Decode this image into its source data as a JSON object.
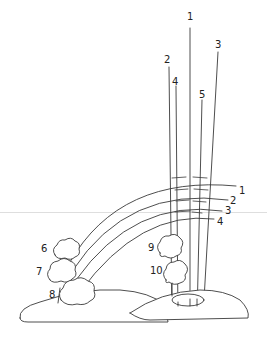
{
  "diagram": {
    "vertical_labels": [
      {
        "id": "v1",
        "text": "1",
        "x": 187,
        "y": 12
      },
      {
        "id": "v2",
        "text": "2",
        "x": 164,
        "y": 55
      },
      {
        "id": "v4",
        "text": "4",
        "x": 172,
        "y": 77
      },
      {
        "id": "v5",
        "text": "5",
        "x": 199,
        "y": 90
      },
      {
        "id": "v3",
        "text": "3",
        "x": 215,
        "y": 40
      }
    ],
    "arc_labels": [
      {
        "id": "a1",
        "text": "1",
        "x": 239,
        "y": 186
      },
      {
        "id": "a2",
        "text": "2",
        "x": 230,
        "y": 196
      },
      {
        "id": "a3",
        "text": "3",
        "x": 225,
        "y": 206
      },
      {
        "id": "a4",
        "text": "4",
        "x": 217,
        "y": 217
      }
    ],
    "tree_labels": [
      {
        "id": "t6",
        "text": "6",
        "x": 41,
        "y": 244
      },
      {
        "id": "t7",
        "text": "7",
        "x": 36,
        "y": 267
      },
      {
        "id": "t8",
        "text": "8",
        "x": 49,
        "y": 290
      },
      {
        "id": "t9",
        "text": "9",
        "x": 148,
        "y": 243
      },
      {
        "id": "t10",
        "text": "10",
        "x": 152,
        "y": 266
      }
    ],
    "colors": {
      "line": "#3a3a3a",
      "background": "#ffffff",
      "guide": "#dedede"
    }
  }
}
